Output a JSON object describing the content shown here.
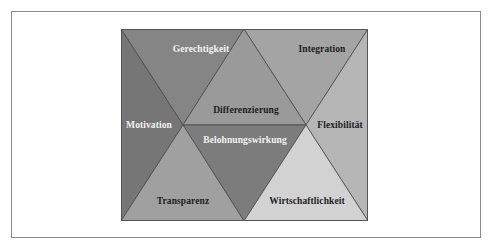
{
  "diagram": {
    "segments": [
      {
        "id": "gerechtigkeit",
        "label": "Gerechtigkeit",
        "fill": "#858585",
        "text_color": "light",
        "points": "0,0 123,0 62,96",
        "label_pos": [
          80,
          20
        ]
      },
      {
        "id": "integration",
        "label": "Integration",
        "fill": "#a4a4a4",
        "text_color": "dark",
        "points": "123,0 247,0 185,96",
        "label_pos": [
          201,
          20
        ]
      },
      {
        "id": "differenzierung",
        "label": "Differenzierung",
        "fill": "#9a9a9a",
        "text_color": "dark",
        "points": "123,0 62,96 185,96",
        "label_pos": [
          125,
          81
        ]
      },
      {
        "id": "belohnungswirkung",
        "label": "Belohnungswirkung",
        "fill": "#7c7c7c",
        "text_color": "light",
        "points": "62,96 185,96 123,192",
        "label_pos": [
          124,
          111
        ]
      },
      {
        "id": "motivation",
        "label": "Motivation",
        "fill": "#767676",
        "text_color": "light",
        "points": "0,0 62,96 0,192",
        "label_pos": [
          28,
          96
        ]
      },
      {
        "id": "transparenz",
        "label": "Transparenz",
        "fill": "#a0a0a0",
        "text_color": "dark",
        "points": "62,96 0,192 123,192",
        "label_pos": [
          62,
          172
        ]
      },
      {
        "id": "flexibilitaet",
        "label": "Flexibilität",
        "fill": "#b6b6b6",
        "text_color": "dark",
        "points": "247,0 185,96 247,192",
        "label_pos": [
          219,
          96
        ]
      },
      {
        "id": "wirtschaftlichkeit",
        "label": "Wirtschaftlichkeit",
        "fill": "#d2d2d2",
        "text_color": "dark",
        "points": "185,96 123,192 247,192",
        "label_pos": [
          186,
          172
        ]
      }
    ],
    "stroke_color": "#4a4a4a"
  }
}
